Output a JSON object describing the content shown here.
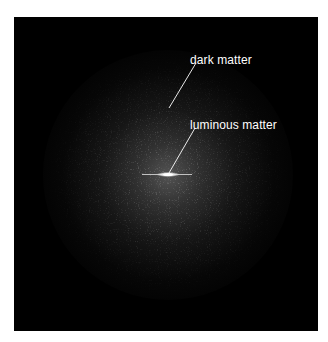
{
  "figure": {
    "type": "illustration",
    "background_color": "#000000",
    "halo_color": "#969696",
    "disk_color": "#ffffff"
  },
  "labels": {
    "dark_matter": "dark matter",
    "luminous_matter": "luminous matter"
  }
}
